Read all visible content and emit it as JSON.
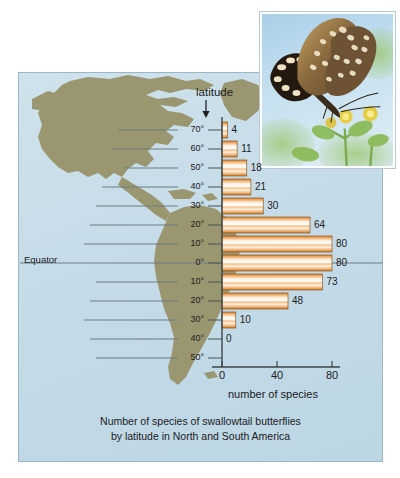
{
  "figure": {
    "caption_line1": "Number of species of swallowtail butterflies",
    "caption_line2": "by latitude in North and South America",
    "equator_label": "Equator",
    "latitude_title": "latitude",
    "photo_alt": "butterfly-photo"
  },
  "chart_data": {
    "type": "bar",
    "orientation": "horizontal",
    "title": "Number of species of swallowtail butterflies by latitude in North and South America",
    "xlabel": "number of species",
    "ylabel": "latitude",
    "xlim": [
      0,
      88
    ],
    "xticks": [
      0,
      40,
      80
    ],
    "xtick_labels": [
      "0",
      "40",
      "80"
    ],
    "grid": false,
    "categories": [
      "70°",
      "60°",
      "50°",
      "40°",
      "30°",
      "20°",
      "10°",
      "0°",
      "10°",
      "20°",
      "30°",
      "40°",
      "50°"
    ],
    "values": [
      4,
      11,
      18,
      21,
      30,
      64,
      80,
      80,
      73,
      48,
      10,
      0,
      0
    ],
    "data_labels": [
      "4",
      "11",
      "18",
      "21",
      "30",
      "64",
      "80",
      "80",
      "73",
      "48",
      "10",
      "0"
    ],
    "bar_color": "#e8943f",
    "bar_highlight": "#fdf2e2"
  },
  "colors": {
    "panel_background": "#c6dce8",
    "land": "#9a9670",
    "water": "#c6dce8",
    "text": "#1c2022",
    "axis": "#4a5256",
    "gridline": "#6d7a80"
  }
}
